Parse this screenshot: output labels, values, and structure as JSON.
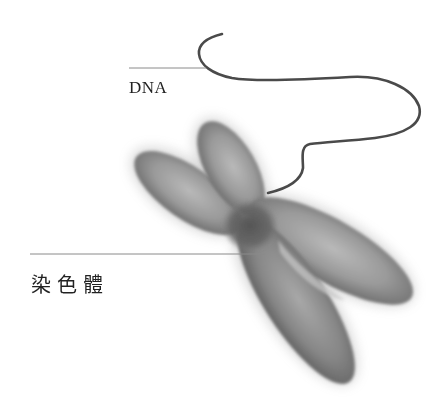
{
  "figure": {
    "labels": {
      "dna": "DNA",
      "chromosome": "染色體"
    },
    "colors": {
      "background": "#ffffff",
      "label_text": "#222222",
      "leader_line": "#8a8a8a",
      "dna_strand": "#4a4a4a",
      "chromatid_light": "#b8b8b8",
      "chromatid_mid": "#8c8c8c",
      "chromatid_dark": "#5e5e5e",
      "centromere": "#555555"
    }
  }
}
